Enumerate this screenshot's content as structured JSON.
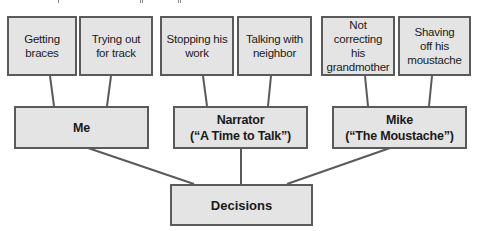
{
  "diagram": {
    "type": "tree",
    "colors": {
      "box_fill": "#e4e4e4",
      "box_border": "#5a5a5a",
      "connector": "#5a5a5a",
      "text": "#1a1a1a"
    },
    "leaves": [
      {
        "label": "Getting\nbraces",
        "parent": "me"
      },
      {
        "label": "Trying out\nfor track",
        "parent": "me"
      },
      {
        "label": "Stopping his\nwork",
        "parent": "narrator"
      },
      {
        "label": "Talking with\nneighbor",
        "parent": "narrator"
      },
      {
        "label": "Not correcting\nhis\ngrandmother",
        "parent": "mike"
      },
      {
        "label": "Shaving\noff his\nmoustache",
        "parent": "mike"
      }
    ],
    "middle": [
      {
        "id": "me",
        "label": "Me"
      },
      {
        "id": "narrator",
        "label": "Narrator\n(“A Time to Talk”)"
      },
      {
        "id": "mike",
        "label": "Mike\n(“The Moustache”)"
      }
    ],
    "root": {
      "label": "Decisions"
    }
  }
}
